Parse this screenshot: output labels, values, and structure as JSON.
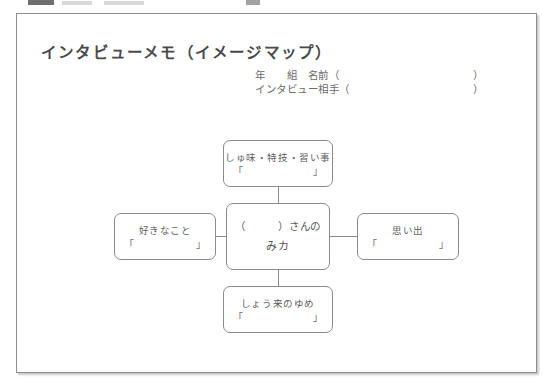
{
  "chrome": {
    "description": "cut-off-toolbar-strip"
  },
  "document": {
    "title": "インタビューメモ（イメージマップ）",
    "header_fields": [
      {
        "label": "年　　組　名前（",
        "close": "）"
      },
      {
        "label": "インタビュー相手（",
        "close": "）"
      }
    ]
  },
  "mindmap": {
    "center": {
      "line1": "（　　　）さんの",
      "line2": "みカ"
    },
    "nodes": [
      {
        "id": "hobby",
        "label": "しゅ味・特技・習い事",
        "quote_open": "「",
        "quote_close": "」"
      },
      {
        "id": "likes",
        "label": "好きなこと",
        "quote_open": "「",
        "quote_close": "」"
      },
      {
        "id": "memory",
        "label": "思い出",
        "quote_open": "「",
        "quote_close": "」"
      },
      {
        "id": "dream",
        "label": "しょう来のゆめ",
        "quote_open": "「",
        "quote_close": "」"
      }
    ]
  },
  "colors": {
    "page_background": "#ffffff",
    "frame_border": "#8d8d8d",
    "node_border": "#8a8a8a",
    "text": "#5a5a5a"
  }
}
